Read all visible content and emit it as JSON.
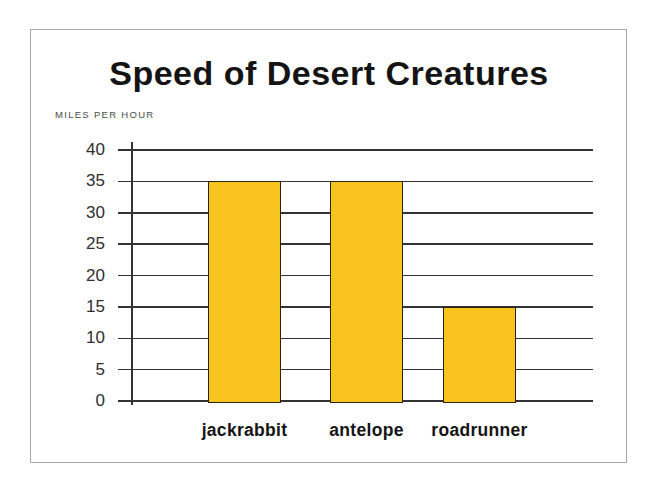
{
  "chart_data": {
    "type": "bar",
    "title": "Speed of Desert Creatures",
    "ylabel": "MILES PER HOUR",
    "xlabel": "",
    "categories": [
      "jackrabbit",
      "antelope",
      "roadrunner"
    ],
    "values": [
      35,
      35,
      15
    ],
    "yticks": [
      40,
      35,
      30,
      25,
      20,
      15,
      10,
      5,
      0
    ],
    "ylim": [
      0,
      40
    ],
    "grid": true,
    "legend": "none",
    "bar_color": "#F9C41F",
    "bar_border_color": "#2a220c",
    "grid_color": "#333333",
    "frame_border_color": "#a8a8a8",
    "text_color": "#141414"
  }
}
